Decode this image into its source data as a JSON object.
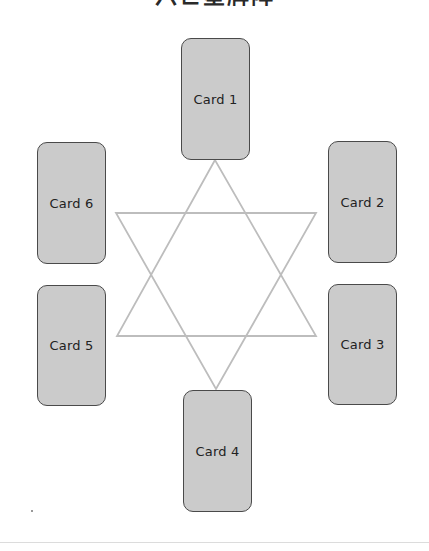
{
  "title": "六芒星牌阵",
  "colors": {
    "card_fill": "#c6c6c6",
    "card_border": "#4a4a4a",
    "star_line": "#bdbdbd",
    "label": "#222222"
  },
  "cards": [
    {
      "label": "Card 1",
      "position": "top",
      "x": 181,
      "y": 38,
      "w": 69,
      "h": 122
    },
    {
      "label": "Card 2",
      "position": "upper-right",
      "x": 328,
      "y": 141,
      "w": 69,
      "h": 122
    },
    {
      "label": "Card 3",
      "position": "lower-right",
      "x": 328,
      "y": 284,
      "w": 69,
      "h": 121
    },
    {
      "label": "Card 4",
      "position": "bottom",
      "x": 183,
      "y": 390,
      "w": 69,
      "h": 122
    },
    {
      "label": "Card 5",
      "position": "lower-left",
      "x": 37,
      "y": 285,
      "w": 69,
      "h": 121
    },
    {
      "label": "Card 6",
      "position": "upper-left",
      "x": 37,
      "y": 142,
      "w": 69,
      "h": 122
    }
  ],
  "star": {
    "triangle_up": {
      "points": "215,160 117,336 316,336"
    },
    "triangle_down": {
      "points": "116,213 316,213 216,389"
    }
  }
}
